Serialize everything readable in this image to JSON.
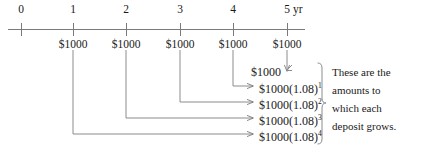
{
  "diagram": {
    "line_color": "#7a7a7a",
    "text_color": "#1a1a1a",
    "background": "#ffffff",
    "interest_rate_factor": "1.08",
    "deposit_amount": "$1000"
  },
  "timeline": {
    "unit_label": "yr",
    "ticks": [
      {
        "label": "0",
        "x": 21
      },
      {
        "label": "1",
        "x": 73
      },
      {
        "label": "2",
        "x": 126
      },
      {
        "label": "3",
        "x": 180
      },
      {
        "label": "4",
        "x": 233
      },
      {
        "label": "5",
        "x": 287
      }
    ],
    "deposits": [
      {
        "label": "$1000",
        "x": 73
      },
      {
        "label": "$1000",
        "x": 126
      },
      {
        "label": "$1000",
        "x": 180
      },
      {
        "label": "$1000",
        "x": 233
      },
      {
        "label": "$1000",
        "x": 287
      }
    ]
  },
  "growth_rows": [
    {
      "base": "$1000",
      "factor": "",
      "exponent": "",
      "from_year": 5,
      "y": 72
    },
    {
      "base": "$1000(1.08)",
      "factor": "1.08",
      "exponent": "1",
      "from_year": 4,
      "y": 89
    },
    {
      "base": "$1000(1.08)",
      "factor": "1.08",
      "exponent": "2",
      "from_year": 3,
      "y": 105
    },
    {
      "base": "$1000(1.08)",
      "factor": "1.08",
      "exponent": "3",
      "from_year": 2,
      "y": 121
    },
    {
      "base": "$1000(1.08)",
      "factor": "1.08",
      "exponent": "4",
      "from_year": 1,
      "y": 137
    }
  ],
  "annotation": {
    "line1": "These are the",
    "line2": "amounts to",
    "line3": "which each",
    "line4": "deposit grows."
  }
}
